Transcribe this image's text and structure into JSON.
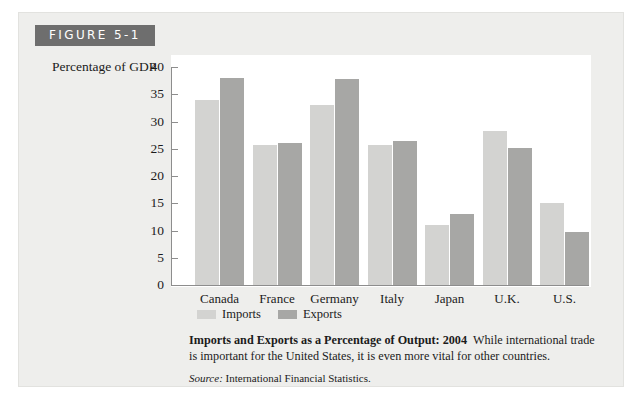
{
  "figure": {
    "tab_label": "FIGURE 5-1"
  },
  "legend": {
    "imports_label": "Imports",
    "exports_label": "Exports"
  },
  "caption": {
    "title": "Imports and Exports as a Percentage of Output: 2004",
    "body": "While international trade is important for the United States, it is even more vital for other countries.",
    "source_label": "Source:",
    "source_text": "International Financial Statistics."
  },
  "colors": {
    "imports": "#d3d3d1",
    "exports": "#a7a7a5",
    "card_background": "#eeeeec",
    "tab_background": "#6e6e6e",
    "axis": "#8d8d8d"
  },
  "chart_data": {
    "type": "bar",
    "title": "Imports and Exports as a Percentage of Output: 2004",
    "xlabel": "",
    "ylabel": "Percentage of GDP",
    "ylim": [
      0,
      40
    ],
    "yticks": [
      0,
      5,
      10,
      15,
      20,
      25,
      30,
      35,
      40
    ],
    "grid": false,
    "legend_position": "bottom-left",
    "categories": [
      "Canada",
      "France",
      "Germany",
      "Italy",
      "Japan",
      "U.K.",
      "U.S."
    ],
    "series": [
      {
        "name": "Imports",
        "values": [
          34,
          25.7,
          33,
          25.7,
          11,
          28.2,
          15.1
        ]
      },
      {
        "name": "Exports",
        "values": [
          38,
          26,
          37.8,
          26.5,
          13,
          25.1,
          9.8
        ]
      }
    ]
  }
}
